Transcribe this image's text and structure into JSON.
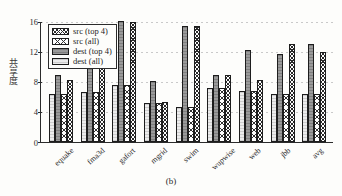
{
  "caption": "(b)",
  "axis": {
    "ylabel": "共享度",
    "yticks": [
      "16",
      "12",
      "8",
      "4",
      "0"
    ]
  },
  "legend": {
    "items": [
      {
        "label": "src (top 4)",
        "swatch": "crosshatch-dense-pattern"
      },
      {
        "label": "src (all)",
        "swatch": "crosshatch-wide-pattern"
      },
      {
        "label": "dest (top 4)",
        "swatch": "dark-gray-fill"
      },
      {
        "label": "dest (all)",
        "swatch": "light-gray-fill"
      }
    ]
  },
  "chart_data": {
    "type": "bar",
    "title": "",
    "xlabel": "",
    "ylabel": "共享度",
    "ylim": [
      0,
      16
    ],
    "yticks": [
      0,
      4,
      8,
      12,
      16
    ],
    "grid": true,
    "legend_position": "upper-left",
    "categories": [
      "equake",
      "fma3d",
      "gafort",
      "mgrid",
      "swim",
      "wupwise",
      "web",
      "jbb",
      "avg"
    ],
    "series": [
      {
        "name": "dest (all)",
        "values": [
          6.4,
          6.6,
          7.6,
          5.1,
          4.6,
          7.1,
          6.8,
          6.4,
          6.4
        ]
      },
      {
        "name": "dest (top 4)",
        "values": [
          8.8,
          9.8,
          16.0,
          8.1,
          15.3,
          8.9,
          12.2,
          11.6,
          12.9
        ]
      },
      {
        "name": "src (all)",
        "values": [
          6.4,
          6.6,
          7.6,
          5.1,
          4.6,
          7.1,
          6.8,
          6.4,
          6.4
        ]
      },
      {
        "name": "src (top 4)",
        "values": [
          8.2,
          9.8,
          15.9,
          5.3,
          15.3,
          8.9,
          8.2,
          12.9,
          11.9
        ]
      }
    ]
  }
}
